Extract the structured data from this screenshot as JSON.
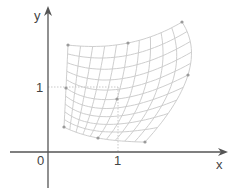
{
  "diagram": {
    "type": "bilinear/quadratic patch mapping of the unit square",
    "axes": {
      "x_label": "x",
      "y_label": "y",
      "origin_label": "0",
      "x_tick_label": "1",
      "y_tick_label": "1"
    },
    "colors": {
      "axis": "#555555",
      "grid": "#c8c8c8",
      "control_point": "#9a9a9a",
      "guide": "#bbbbbb"
    },
    "grid_divisions": 10,
    "control_points": [
      {
        "name": "top-left",
        "x": 68,
        "y": 45
      },
      {
        "name": "top-middle",
        "x": 128,
        "y": 43
      },
      {
        "name": "top-right",
        "x": 182,
        "y": 22
      },
      {
        "name": "middle-left",
        "x": 66,
        "y": 88
      },
      {
        "name": "center",
        "x": 117,
        "y": 99
      },
      {
        "name": "middle-right",
        "x": 188,
        "y": 75
      },
      {
        "name": "bottom-left",
        "x": 64,
        "y": 127
      },
      {
        "name": "bottom-middle",
        "x": 98,
        "y": 138
      },
      {
        "name": "bottom-right",
        "x": 145,
        "y": 142
      }
    ]
  }
}
